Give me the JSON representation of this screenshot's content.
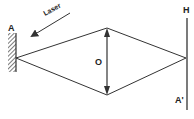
{
  "diagram": {
    "labels": {
      "mirror": "A",
      "laser": "Laser",
      "object": "O",
      "hologram_top": "H",
      "image": "A'"
    },
    "colors": {
      "line": "#333333",
      "background": "#ffffff"
    }
  }
}
